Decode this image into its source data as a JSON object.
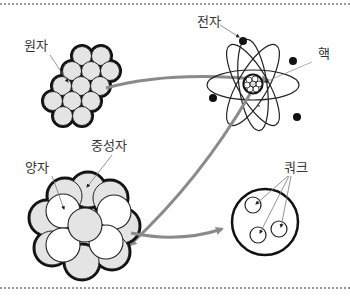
{
  "labels": {
    "atom": "원자",
    "electron": "전자",
    "nucleus": "핵",
    "proton": "양자",
    "neutron": "중성자",
    "quark": "쿼크"
  },
  "colors": {
    "outline": "#111111",
    "nucleon_fill": "#e4e4e4",
    "arrow": "#8a8a8a",
    "leader_line": "#777777",
    "text": "#333333",
    "divider": "#9a9a9a"
  },
  "icons": {
    "atom_cluster": "atom-cluster-icon",
    "atom_model": "atom-model-icon",
    "nucleus_cluster": "nucleus-cluster-icon",
    "nucleon_quarks": "quark-circle-icon"
  }
}
